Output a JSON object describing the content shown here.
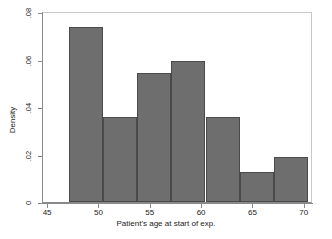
{
  "chart_data": {
    "type": "bar",
    "subtype": "histogram",
    "title": "",
    "xlabel": "Patient's age at start of exp.",
    "ylabel": "Density",
    "xlim": [
      44.5,
      70.8
    ],
    "ylim": [
      0,
      0.0805
    ],
    "grid": false,
    "legend": null,
    "bar_color": "#6e6e6e",
    "bar_edge_color": "#4a4a4a",
    "background_color": "#ffffff",
    "frame_color": "#c8c8c8",
    "axis_color": "#8a8a8a",
    "xticks": [
      45,
      50,
      55,
      60,
      65,
      70
    ],
    "xtick_labels": [
      "45",
      "50",
      "55",
      "60",
      "65",
      "70"
    ],
    "yticks": [
      0,
      0.02,
      0.04,
      0.06,
      0.08
    ],
    "ytick_labels": [
      "0",
      ".02",
      ".04",
      ".06",
      ".08"
    ],
    "bin_edges": [
      47.0,
      50.33,
      53.67,
      57.0,
      60.33,
      63.67,
      67.0,
      70.33
    ],
    "bin_width": 3.33,
    "values": [
      0.0737,
      0.0358,
      0.0543,
      0.0594,
      0.0358,
      0.0126,
      0.0189
    ],
    "bins": [
      {
        "x0": 47.0,
        "x1": 50.33,
        "density": 0.0737
      },
      {
        "x0": 50.33,
        "x1": 53.67,
        "density": 0.0358
      },
      {
        "x0": 53.67,
        "x1": 57.0,
        "density": 0.0543
      },
      {
        "x0": 57.0,
        "x1": 60.33,
        "density": 0.0594
      },
      {
        "x0": 60.33,
        "x1": 63.67,
        "density": 0.0358
      },
      {
        "x0": 63.67,
        "x1": 67.0,
        "density": 0.0126
      },
      {
        "x0": 67.0,
        "x1": 70.33,
        "density": 0.0189
      }
    ]
  }
}
